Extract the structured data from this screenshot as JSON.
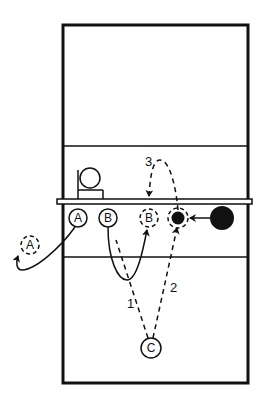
{
  "diagram": {
    "type": "volleyball-court-drill",
    "colors": {
      "line": "#111111",
      "background": "#ffffff"
    },
    "court": {
      "outline": {
        "x": 63,
        "y": 25,
        "w": 185,
        "h": 358
      },
      "net_y": 202,
      "attack_line_far_y": 146,
      "attack_line_near_y": 257
    },
    "coach_box": {
      "label": ""
    },
    "players": [
      {
        "id": "A",
        "label": "A",
        "x": 78,
        "y": 218,
        "style": "solid"
      },
      {
        "id": "B",
        "label": "B",
        "x": 108,
        "y": 218,
        "style": "solid"
      },
      {
        "id": "B2",
        "label": "B",
        "x": 149,
        "y": 218,
        "style": "dashed"
      },
      {
        "id": "A2",
        "label": "A",
        "x": 30,
        "y": 245,
        "style": "dashed"
      },
      {
        "id": "C",
        "label": "C",
        "x": 151,
        "y": 348,
        "style": "solid"
      }
    ],
    "balls": [
      {
        "id": "ball-target",
        "x": 178,
        "y": 218,
        "r": 8,
        "style": "dashed-ring"
      },
      {
        "id": "ball-source",
        "x": 222,
        "y": 218,
        "r": 12,
        "style": "solid"
      }
    ],
    "paths": [
      {
        "id": "path-1",
        "label": "1",
        "style": "dashed",
        "from": "C",
        "to": "B-start"
      },
      {
        "id": "path-2",
        "label": "2",
        "style": "dashed",
        "from": "C",
        "to": "ball-target"
      },
      {
        "id": "path-3",
        "label": "3",
        "style": "dashed",
        "from": "ball-target",
        "to": "B2"
      }
    ],
    "path_labels": {
      "one": "1",
      "two": "2",
      "three": "3"
    }
  }
}
